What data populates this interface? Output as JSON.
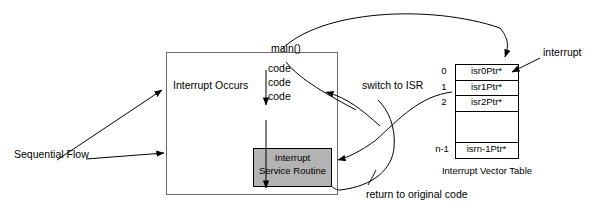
{
  "diagram": {
    "main_box": {
      "title": "main()",
      "interrupt_occurs_label": "Interrupt Occurs",
      "code_lines": [
        "code",
        "code",
        "code"
      ],
      "isr_box": {
        "line1": "Interrupt",
        "line2": "Service Routine",
        "fill": "#b3b3b3"
      }
    },
    "labels": {
      "sequential_flow": "Sequential Flow",
      "switch_to_isr": "switch to ISR",
      "return_to_original_code": "return to original code",
      "interrupt": "interrupt"
    },
    "vector_table": {
      "caption": "Interrupt Vector Table",
      "rows": [
        {
          "index": "0",
          "value": "isr0Ptr*"
        },
        {
          "index": "1",
          "value": "isr1Ptr*"
        },
        {
          "index": "2",
          "value": "isr2Ptr*"
        },
        {
          "index": "",
          "value": ""
        },
        {
          "index": "n-1",
          "value": "isrn-1Ptr*"
        }
      ]
    },
    "colors": {
      "stroke": "#000000",
      "background": "#ffffff",
      "isr_fill": "#b3b3b3"
    }
  }
}
